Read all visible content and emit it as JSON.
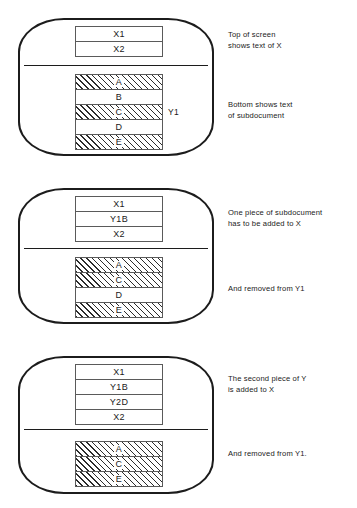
{
  "figure": {
    "title": "Subdocument text transfer sequence",
    "panels": [
      {
        "id": "panel-1",
        "screen_top_rows": [
          {
            "label": "X1",
            "hatched": false
          },
          {
            "label": "X2",
            "hatched": false
          }
        ],
        "screen_bottom_rows": [
          {
            "label": "A",
            "hatched": true
          },
          {
            "label": "B",
            "hatched": false
          },
          {
            "label": "C",
            "hatched": true
          },
          {
            "label": "D",
            "hatched": false
          },
          {
            "label": "E",
            "hatched": true
          }
        ],
        "side_label": "Y1",
        "caption_top": "Top of screen\nshows text of X",
        "caption_bottom": "Bottom shows text\nof subdocument"
      },
      {
        "id": "panel-2",
        "screen_top_rows": [
          {
            "label": "X1",
            "hatched": false
          },
          {
            "label": "Y1B",
            "hatched": false
          },
          {
            "label": "X2",
            "hatched": false
          }
        ],
        "screen_bottom_rows": [
          {
            "label": "A",
            "hatched": true
          },
          {
            "label": "C",
            "hatched": true
          },
          {
            "label": "D",
            "hatched": false
          },
          {
            "label": "E",
            "hatched": true
          }
        ],
        "side_label": "",
        "caption_top": "One piece of subdocument\nhas to be added to X",
        "caption_bottom": "And removed from Y1"
      },
      {
        "id": "panel-3",
        "screen_top_rows": [
          {
            "label": "X1",
            "hatched": false
          },
          {
            "label": "Y1B",
            "hatched": false
          },
          {
            "label": "Y2D",
            "hatched": false
          },
          {
            "label": "X2",
            "hatched": false
          }
        ],
        "screen_bottom_rows": [
          {
            "label": "A",
            "hatched": true
          },
          {
            "label": "C",
            "hatched": true
          },
          {
            "label": "E",
            "hatched": true
          }
        ],
        "side_label": "",
        "caption_top": "The second piece of Y\nis added to X",
        "caption_bottom": "And removed from Y1."
      }
    ],
    "colors": {
      "ink": "#1c1c1c",
      "box_stroke": "#5a5a5a",
      "hatch": "#2b2b2b",
      "background": "#ffffff"
    }
  }
}
